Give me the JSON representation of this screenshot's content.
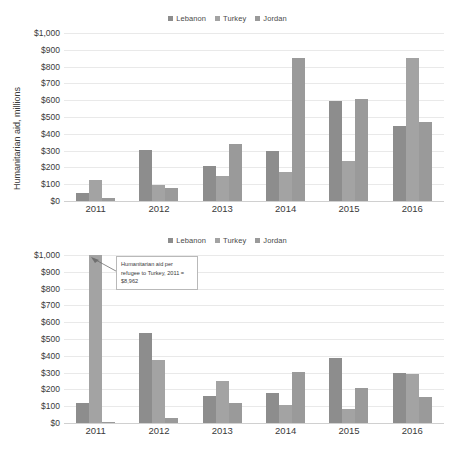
{
  "legend": {
    "items": [
      {
        "label": "Lebanon",
        "color": "#8d8d8d"
      },
      {
        "label": "Turkey",
        "color": "#a3a3a3"
      },
      {
        "label": "Jordan",
        "color": "#9a9a9a"
      }
    ]
  },
  "axis": {
    "ticks": [
      "$1,000",
      "$900",
      "$800",
      "$700",
      "$600",
      "$500",
      "$400",
      "$300",
      "$200",
      "$100",
      "$0"
    ],
    "categories": [
      "2011",
      "2012",
      "2013",
      "2014",
      "2015",
      "2016"
    ]
  },
  "chart1": {
    "ylabel": "Humanitarian aid, millions"
  },
  "chart2": {
    "annotation": "Humanitarian aid per refugee to Turkey, 2011 = $8,962"
  },
  "chart_data": [
    {
      "type": "bar",
      "title": "",
      "xlabel": "",
      "ylabel": "Humanitarian aid, millions",
      "categories": [
        "2011",
        "2012",
        "2013",
        "2014",
        "2015",
        "2016"
      ],
      "series": [
        {
          "name": "Lebanon",
          "values": [
            50,
            305,
            210,
            297,
            593,
            445
          ]
        },
        {
          "name": "Turkey",
          "values": [
            125,
            95,
            148,
            172,
            237,
            850
          ]
        },
        {
          "name": "Jordan",
          "values": [
            20,
            78,
            342,
            850,
            605,
            472
          ]
        }
      ],
      "ylim": [
        0,
        1000
      ],
      "ytick_step": 100,
      "grid": true,
      "legend_position": "top"
    },
    {
      "type": "bar",
      "title": "",
      "xlabel": "",
      "ylabel": "",
      "categories": [
        "2011",
        "2012",
        "2013",
        "2014",
        "2015",
        "2016"
      ],
      "series": [
        {
          "name": "Lebanon",
          "values": [
            118,
            533,
            158,
            180,
            385,
            298
          ]
        },
        {
          "name": "Turkey",
          "values": [
            1000,
            375,
            248,
            108,
            85,
            290
          ]
        },
        {
          "name": "Jordan",
          "values": [
            8,
            28,
            120,
            303,
            207,
            155
          ]
        }
      ],
      "ylim": [
        0,
        1000
      ],
      "ytick_step": 100,
      "grid": true,
      "legend_position": "top",
      "annotations": [
        {
          "text": "Humanitarian aid per refugee to Turkey, 2011 = $8,962",
          "target_series": "Turkey",
          "target_category": "2011",
          "note": "bar clipped at axis maximum"
        }
      ]
    }
  ]
}
